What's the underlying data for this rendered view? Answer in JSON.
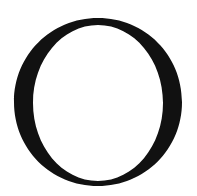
{
  "glyph": {
    "character": "O",
    "style": "serif capital letter",
    "color": "#111111",
    "background": "#ffffff"
  }
}
